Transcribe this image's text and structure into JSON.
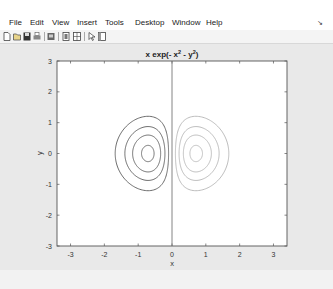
{
  "menubar": {
    "items": [
      "File",
      "Edit",
      "View",
      "Insert",
      "Tools",
      "Desktop",
      "Window",
      "Help"
    ],
    "dock_icon": "dock-arrow-icon"
  },
  "toolbar": {
    "icons": [
      "new-figure-icon",
      "open-file-icon",
      "save-icon",
      "print-icon",
      "print-preview-icon",
      "colorbar-icon",
      "legend-icon",
      "edit-plot-arrow-icon",
      "property-editor-icon"
    ]
  },
  "colors": {
    "figure_bg": "#e9e9e9",
    "axes_bg": "#ffffff",
    "negative_contours": "#5a5a5a",
    "positive_contours": "#b4b4b4"
  },
  "chart_data": {
    "type": "contour",
    "title_parts": {
      "base": "x exp(- x",
      "sup1": "2",
      "mid": " - y",
      "sup2": "2",
      "end": ")"
    },
    "xlabel": "x",
    "ylabel": "y",
    "xlim": [
      -3.4,
      3.4
    ],
    "ylim": [
      -3,
      3
    ],
    "xticks": [
      -3,
      -2,
      -1,
      0,
      1,
      2,
      3
    ],
    "yticks": [
      3,
      2,
      1,
      0,
      -1,
      -2,
      -3
    ],
    "grid": false,
    "function": "z = x*exp(-x^2 - y^2)",
    "levels": [
      -0.4,
      -0.3,
      -0.2,
      -0.1,
      0.1,
      0.2,
      0.3,
      0.4
    ],
    "centers": [
      {
        "x": -0.707,
        "y": 0,
        "sign": "negative"
      },
      {
        "x": 0.707,
        "y": 0,
        "sign": "positive"
      }
    ],
    "vertical_line_at_x": 0
  }
}
